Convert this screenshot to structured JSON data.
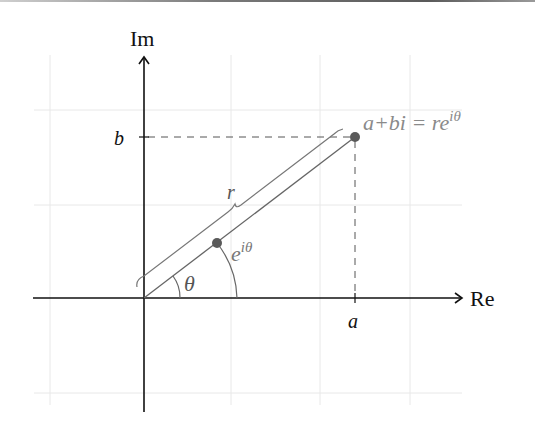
{
  "diagram": {
    "axes": {
      "x_label": "Re",
      "y_label": "Im"
    },
    "ticks": {
      "x_tick": "a",
      "y_tick": "b"
    },
    "labels": {
      "point": "a+bi = re",
      "point_sup": "iθ",
      "radius": "r",
      "unit": "e",
      "unit_sup": "iθ",
      "angle": "θ"
    },
    "colors": {
      "axis": "#111111",
      "grid": "#e6e6e6",
      "gray_line": "#777777",
      "point": "#555555",
      "label_gray": "#8a8a8a"
    }
  }
}
